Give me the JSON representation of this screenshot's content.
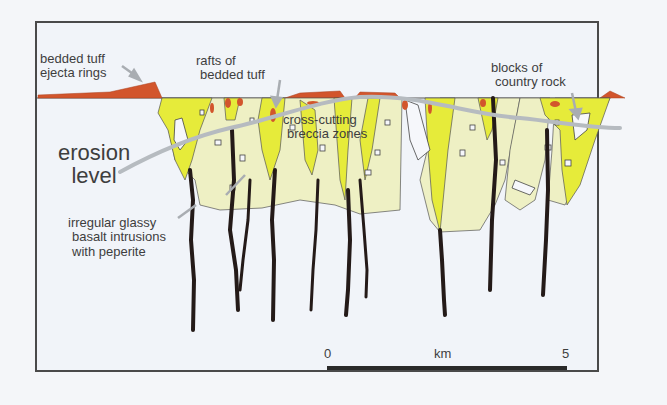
{
  "labels": {
    "ejecta_line1": "bedded tuff",
    "ejecta_line2": "ejecta rings",
    "rafts_line1": "rafts of",
    "rafts_line2": "bedded tuff",
    "cross_line1": "cross-cutting",
    "cross_line2": "breccia zones",
    "blocks_line1": "blocks of",
    "blocks_line2": "country rock",
    "erosion_line1": "erosion",
    "erosion_line2": "level",
    "intrusion_line1": "irregular glassy",
    "intrusion_line2": "basalt intrusions",
    "intrusion_line3": "with peperite"
  },
  "scale_bar": {
    "start": "0",
    "unit": "km",
    "end": "5"
  },
  "colors": {
    "breccia_yellow": "#e6eb3a",
    "breccia_pale": "#eef0c4",
    "tuff_orange": "#d2552c",
    "basalt": "#241a18",
    "arrow_grey": "#a9adb2",
    "background": "#f1f4f9",
    "frame": "#4a4a4a",
    "text": "#3e3e3e"
  }
}
